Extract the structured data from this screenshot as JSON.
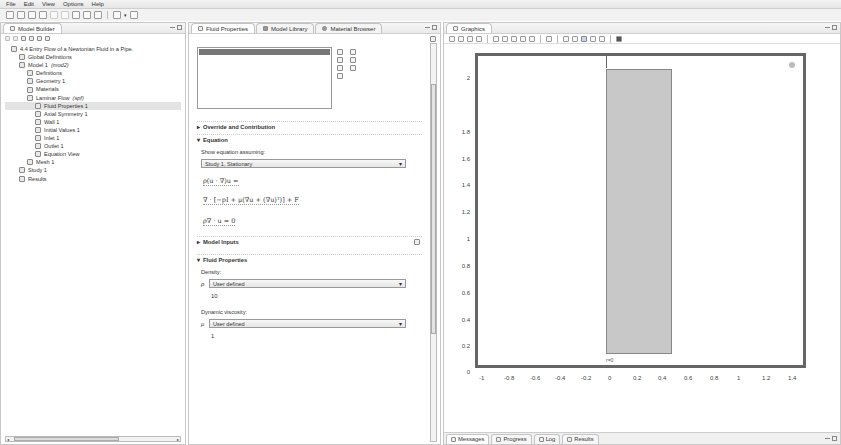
{
  "menu": [
    "File",
    "Edit",
    "View",
    "Options",
    "Help"
  ],
  "toolbar": {
    "icons": [
      "new-file-icon",
      "open-icon",
      "save-icon",
      "print-icon",
      "undo-icon",
      "redo-icon",
      "settings-icon",
      "layout-icon",
      "window-icon",
      "build-icon",
      "dropdown-icon",
      "extra-icon"
    ]
  },
  "model_builder": {
    "title": "Model Builder",
    "tree": [
      {
        "label": "4.4 Entry Flow of a Newtonian Fluid in a Pipe.",
        "indent": 0,
        "icon": "model-root-icon"
      },
      {
        "label": "Global Definitions",
        "indent": 1,
        "icon": "global-definitions-icon"
      },
      {
        "label": "Model 1",
        "suffix": "(mod2)",
        "indent": 1,
        "icon": "model-icon"
      },
      {
        "label": "Definitions",
        "indent": 2,
        "icon": "definitions-icon"
      },
      {
        "label": "Geometry 1",
        "indent": 2,
        "icon": "geometry-icon"
      },
      {
        "label": "Materials",
        "indent": 2,
        "icon": "materials-icon"
      },
      {
        "label": "Laminar Flow",
        "suffix": "(spf)",
        "indent": 2,
        "icon": "laminar-flow-icon"
      },
      {
        "label": "Fluid Properties 1",
        "indent": 3,
        "icon": "fluid-properties-icon",
        "selected": true
      },
      {
        "label": "Axial Symmetry 1",
        "indent": 3,
        "icon": "axial-symmetry-icon"
      },
      {
        "label": "Wall 1",
        "indent": 3,
        "icon": "wall-icon"
      },
      {
        "label": "Initial Values 1",
        "indent": 3,
        "icon": "initial-values-icon"
      },
      {
        "label": "Inlet 1",
        "indent": 3,
        "icon": "inlet-icon"
      },
      {
        "label": "Outlet 1",
        "indent": 3,
        "icon": "outlet-icon"
      },
      {
        "label": "Equation View",
        "indent": 3,
        "icon": "equation-view-icon"
      },
      {
        "label": "Mesh 1",
        "indent": 2,
        "icon": "mesh-icon"
      },
      {
        "label": "Study 1",
        "indent": 1,
        "icon": "study-icon"
      },
      {
        "label": "Results",
        "indent": 1,
        "icon": "results-icon"
      }
    ]
  },
  "properties": {
    "tabs": [
      {
        "label": "Fluid Properties",
        "active": true
      },
      {
        "label": "Model Library",
        "active": false
      },
      {
        "label": "Material Browser",
        "active": false
      }
    ],
    "sections": {
      "override": "Override and Contribution",
      "equation": "Equation",
      "model_inputs": "Model Inputs",
      "fluid_properties": "Fluid Properties"
    },
    "show_equation_label": "Show equation assuming:",
    "study_select": "Study 1, Stationary",
    "equations": [
      "ρ(u · ∇)u =",
      "∇ · [−pI + μ(∇u + (∇u)ᵀ)] + F",
      "ρ∇ · u = 0"
    ],
    "density_label": "Density:",
    "density_symbol": "ρ",
    "density_select": "User defined",
    "density_value": "10",
    "viscosity_label": "Dynamic viscosity:",
    "viscosity_symbol": "μ",
    "viscosity_select": "User defined",
    "viscosity_value": "1"
  },
  "graphics": {
    "title": "Graphics",
    "y_ticks": [
      "2",
      "1.8",
      "1.6",
      "1.4",
      "1.2",
      "1",
      "0.8",
      "0.6",
      "0.4",
      "0.2",
      "0"
    ],
    "x_ticks": [
      "-1",
      "-0.8",
      "-0.6",
      "-0.4",
      "-0.2",
      "0",
      "0.2",
      "0.4",
      "0.6",
      "0.8",
      "1",
      "1.2",
      "1.4"
    ],
    "axis_label": "r=0",
    "bottom_tabs": [
      "Messages",
      "Progress",
      "Log",
      "Results"
    ]
  }
}
